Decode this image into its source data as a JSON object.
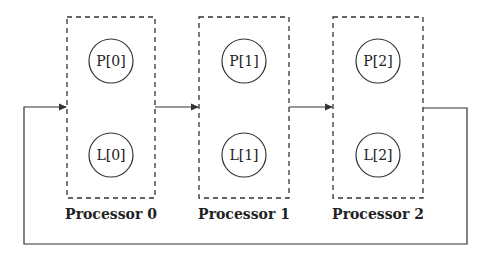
{
  "diagram": {
    "processors": [
      {
        "label": "Processor 0",
        "p_node": "P[0]",
        "l_node": "L[0]"
      },
      {
        "label": "Processor 1",
        "p_node": "P[1]",
        "l_node": "L[1]"
      },
      {
        "label": "Processor 2",
        "p_node": "P[2]",
        "l_node": "L[2]"
      }
    ],
    "connections": [
      {
        "from": "Processor 0",
        "to": "Processor 1",
        "type": "arrow"
      },
      {
        "from": "Processor 1",
        "to": "Processor 2",
        "type": "arrow"
      },
      {
        "from": "Processor 2",
        "to": "Processor 0",
        "type": "ring-return-arrow"
      }
    ],
    "colors": {
      "stroke": "#333333",
      "background": "#ffffff"
    }
  }
}
